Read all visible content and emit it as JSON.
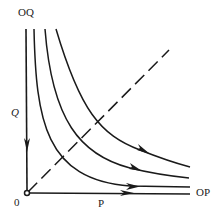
{
  "diagram": {
    "labels": {
      "q_axis_end": "OQ",
      "q_axis": "Q",
      "origin": "0",
      "p_axis": "P",
      "p_axis_end": "OP"
    },
    "colors": {
      "stroke": "#1a1a1a",
      "background": "#ffffff"
    },
    "elements": {
      "trajectories": 4,
      "diagonal": "dashed line through origin",
      "axes": [
        "Q (vertical, arrow toward origin)",
        "P (horizontal, arrow away from origin)"
      ]
    }
  }
}
